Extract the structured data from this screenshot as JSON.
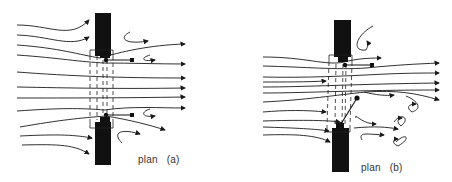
{
  "diagrams": [
    {
      "id": "a",
      "caption_word": "plan",
      "caption_label": "(a)",
      "description": "Symmetric opening: streamlines converge through the gap between two wall piers and exit straight, with small eddies behind both piers"
    },
    {
      "id": "b",
      "caption_word": "plan",
      "caption_label": "(b)",
      "description": "Asymmetric opening: flow deflected upward, large recirculating eddies downstream of the lower pier"
    }
  ],
  "colors": {
    "ink": "#1a1a1a",
    "background": "#ffffff"
  }
}
